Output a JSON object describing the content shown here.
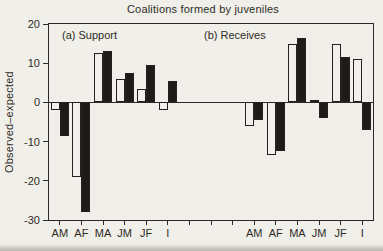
{
  "colors": {
    "background": "#f1efe9",
    "ink": "#2b2a26",
    "bar_filled": "#1d1c19",
    "bar_open": "#f1efe9"
  },
  "chart_data": {
    "type": "bar",
    "title": "Coalitions formed by juveniles",
    "ylabel": "Observed–expected",
    "ylim": [
      -30,
      20
    ],
    "yticks": [
      20,
      10,
      0,
      -10,
      -20,
      -30
    ],
    "ytick_labels": [
      "20",
      "10",
      "0",
      "-10",
      "-20",
      "-30"
    ],
    "grid": false,
    "legend": "none",
    "gap_slots": 3,
    "panels": [
      {
        "label": "(a) Support",
        "categories": [
          "AM",
          "AF",
          "MA",
          "JM",
          "JF",
          "I"
        ],
        "series": [
          {
            "name": "open",
            "values": [
              -2,
              -19,
              12.5,
              6,
              3.5,
              -2
            ]
          },
          {
            "name": "filled",
            "values": [
              -8.5,
              -28,
              13,
              7.5,
              9.5,
              5.5
            ]
          }
        ]
      },
      {
        "label": "(b) Receives",
        "categories": [
          "AM",
          "AF",
          "MA",
          "JM",
          "JF",
          "I"
        ],
        "series": [
          {
            "name": "open",
            "values": [
              -6,
              -13.5,
              15,
              0.5,
              15,
              11
            ]
          },
          {
            "name": "filled",
            "values": [
              -4.5,
              -12.5,
              16.5,
              -4,
              11.5,
              -7
            ]
          }
        ]
      }
    ]
  }
}
